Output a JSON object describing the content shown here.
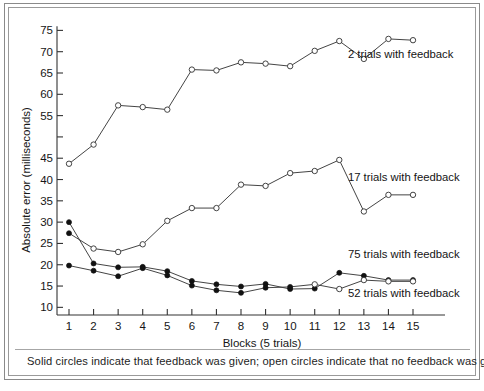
{
  "figure": {
    "caption": "Solid circles indicate that feedback was given; open circles indicate that no feedback was given."
  },
  "chart_data": {
    "type": "line",
    "title": "",
    "xlabel": "Blocks (5 trials)",
    "ylabel": "Absolute error (milliseconds)",
    "x": [
      1,
      2,
      3,
      4,
      5,
      6,
      7,
      8,
      9,
      10,
      11,
      12,
      13,
      14,
      15
    ],
    "xtick_labels": [
      "1",
      "2",
      "3",
      "4",
      "5",
      "6",
      "7",
      "8",
      "9",
      "10",
      "11",
      "12",
      "13",
      "14",
      "15"
    ],
    "ytick_labels": [
      "10",
      "15",
      "20",
      "25",
      "30",
      "35",
      "40",
      "45",
      "",
      "55",
      "60",
      "65",
      "70",
      "75"
    ],
    "ytick_values": [
      10,
      15,
      20,
      25,
      30,
      35,
      40,
      45,
      50,
      55,
      60,
      65,
      70,
      75
    ],
    "ylim": [
      7.5,
      76.5
    ],
    "xlim": [
      0.45,
      15.6
    ],
    "grid": false,
    "legend_position": "inline-right",
    "series": [
      {
        "name": "2 trials with feedback",
        "label": "2 trials with feedback",
        "marker": "open-circle",
        "values": [
          43.7,
          48.2,
          57.4,
          57.0,
          56.4,
          65.8,
          65.6,
          67.5,
          67.2,
          66.6,
          70.2,
          72.5,
          68.3,
          73.0,
          72.7
        ],
        "feedback_flags": [
          false,
          false,
          false,
          false,
          false,
          false,
          false,
          false,
          false,
          false,
          false,
          false,
          false,
          false,
          false
        ],
        "label_x": 12.35,
        "label_y": 68.6
      },
      {
        "name": "17 trials with feedback",
        "label": "17 trials with feedback",
        "marker": "open-circle",
        "values": [
          27.4,
          23.8,
          23.0,
          24.8,
          30.3,
          33.3,
          33.3,
          38.8,
          38.5,
          41.5,
          42.0,
          44.6,
          32.5,
          36.4,
          36.4
        ],
        "feedback_flags": [
          true,
          false,
          false,
          false,
          false,
          false,
          false,
          false,
          false,
          false,
          false,
          false,
          false,
          false,
          false
        ],
        "label_x": 12.35,
        "label_y": 39.6
      },
      {
        "name": "75 trials with feedback",
        "label": "75 trials with feedback",
        "marker": "solid-circle",
        "values": [
          30.0,
          20.3,
          19.4,
          19.5,
          18.5,
          16.2,
          15.4,
          14.9,
          15.5,
          14.3,
          14.4,
          18.1,
          17.4,
          16.4,
          16.4
        ],
        "feedback_flags": [
          true,
          true,
          true,
          true,
          true,
          true,
          true,
          true,
          true,
          true,
          true,
          true,
          true,
          true,
          true
        ],
        "label_x": 12.35,
        "label_y": 21.6
      },
      {
        "name": "52 trials with feedback",
        "label": "52 trials with feedback",
        "marker": "mixed",
        "values": [
          19.8,
          18.6,
          17.3,
          19.2,
          17.5,
          15.1,
          14.0,
          13.4,
          14.6,
          14.8,
          15.4,
          14.3,
          16.4,
          16.1,
          16.1
        ],
        "feedback_flags": [
          true,
          true,
          true,
          true,
          true,
          true,
          true,
          true,
          true,
          true,
          false,
          false,
          false,
          false,
          false
        ],
        "label_x": 12.35,
        "label_y": 12.4
      }
    ]
  }
}
